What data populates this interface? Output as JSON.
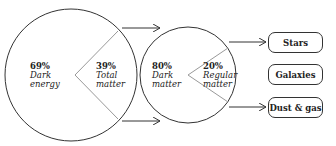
{
  "diagram": {
    "outer_circle": {
      "segments": [
        {
          "percent": "69%",
          "label_line1": "Dark",
          "label_line2": "energy"
        },
        {
          "percent": "39%",
          "label_line1": "Total",
          "label_line2": "matter"
        }
      ]
    },
    "matter_circle": {
      "segments": [
        {
          "percent": "80%",
          "label_line1": "Dark",
          "label_line2": "matter"
        },
        {
          "percent": "20%",
          "label_line1": "Regular",
          "label_line2": "matter"
        }
      ]
    },
    "outcomes": [
      {
        "label": "Stars"
      },
      {
        "label": "Galaxies"
      },
      {
        "label": "Dust & gas"
      }
    ],
    "colors": {
      "stroke": "#333333",
      "wedge": "#999999",
      "background": "#ffffff"
    }
  }
}
